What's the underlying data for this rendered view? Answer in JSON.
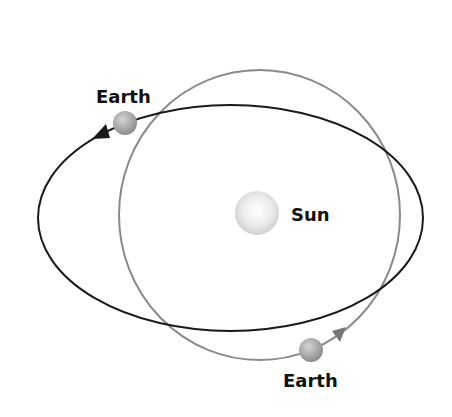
{
  "diagram": {
    "labels": {
      "earth_top": "Earth",
      "earth_bottom": "Earth",
      "sun": "Sun"
    },
    "orbits": [
      {
        "name": "elliptical-orbit",
        "color": "#1a1a1a",
        "cx": 230.5,
        "cy": 218,
        "rx": 192.5,
        "ry": 113
      },
      {
        "name": "circular-orbit",
        "color": "#8a8a8a",
        "cx": 259.5,
        "cy": 215,
        "rx": 140.5,
        "ry": 145
      }
    ],
    "bodies": {
      "sun": {
        "cx": 257,
        "cy": 213,
        "r": 22
      },
      "earth_top": {
        "cx": 125,
        "cy": 123,
        "r": 12
      },
      "earth_bottom": {
        "cx": 311,
        "cy": 350,
        "r": 12
      }
    },
    "colors": {
      "elliptical_orbit": "#1a1a1a",
      "circular_orbit": "#8a8a8a",
      "earth": "#a8a8a8",
      "sun": "#e6e6e6",
      "arrow_top": "#1a1a1a",
      "arrow_bottom": "#777777"
    }
  }
}
